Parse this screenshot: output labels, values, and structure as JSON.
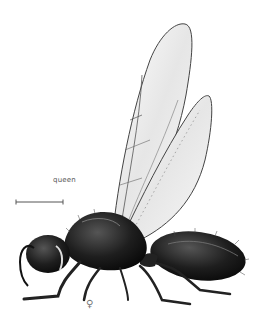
{
  "illustration": {
    "subject": "winged queen insect, lateral view",
    "caste_label": "queen",
    "sex_symbol": "♀",
    "scale_bar": {
      "x1": 16,
      "x2": 63,
      "y": 202
    },
    "colors": {
      "background": "#ffffff",
      "body": "#1a1a1a",
      "wing_fill": "#f2f2f2",
      "wing_stroke": "#444444",
      "label": "#555555"
    }
  }
}
